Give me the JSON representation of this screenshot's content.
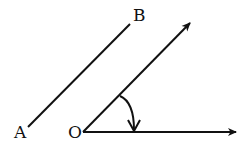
{
  "diagram": {
    "type": "geometry",
    "labels": {
      "A": "A",
      "B": "B",
      "O": "O"
    },
    "colors": {
      "stroke": "#111111",
      "background": "#ffffff"
    },
    "elements": [
      {
        "id": "segment-AB",
        "from": "A",
        "to": "B"
      },
      {
        "id": "ray-oblique",
        "from": "O",
        "direction": "up-right",
        "arrow": true
      },
      {
        "id": "ray-horizontal",
        "from": "O",
        "direction": "right",
        "arrow": true
      },
      {
        "id": "angle-arc",
        "from": "ray-oblique",
        "to": "ray-horizontal",
        "arrow": true
      }
    ]
  }
}
